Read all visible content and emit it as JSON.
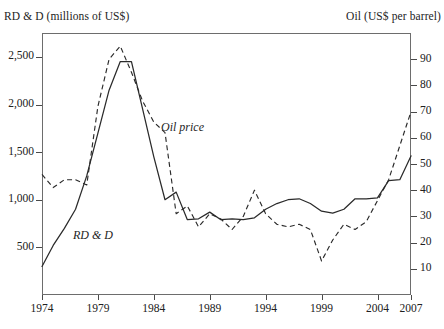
{
  "titles": {
    "left_axis": "RD & D (millions of US$)",
    "right_axis": "Oil (US$ per barrel)"
  },
  "series_labels": {
    "oil": "Oil price",
    "rdd": "RD & D"
  },
  "axes": {
    "left": {
      "label": "RD & D (millions of US$)",
      "ticks": [
        "500",
        "1,000",
        "1,500",
        "2,000",
        "2,500"
      ],
      "values": [
        500,
        1000,
        1500,
        2000,
        2500
      ],
      "range": [
        0,
        2750
      ]
    },
    "right": {
      "label": "Oil (US$ per barrel)",
      "ticks": [
        "10",
        "20",
        "30",
        "40",
        "50",
        "60",
        "70",
        "80",
        "90"
      ],
      "values": [
        10,
        20,
        30,
        40,
        50,
        60,
        70,
        80,
        90
      ],
      "range": [
        0,
        100
      ]
    },
    "bottom": {
      "ticks": [
        "1974",
        "1979",
        "1984",
        "1989",
        "1994",
        "1999",
        "2004",
        "2007"
      ],
      "values": [
        1974,
        1979,
        1984,
        1989,
        1994,
        1999,
        2004,
        2007
      ],
      "range": [
        1974,
        2007
      ]
    }
  },
  "chart_data": {
    "type": "line",
    "title": "",
    "subtitle": "",
    "xlabel": "",
    "ylabel": "RD & D (millions of US$)",
    "y2label": "Oil (US$ per barrel)",
    "xlim": [
      1974,
      2007
    ],
    "ylim": [
      0,
      2750
    ],
    "y2lim": [
      0,
      100
    ],
    "grid": false,
    "legend": "inline-annotations",
    "x": [
      1974,
      1975,
      1976,
      1977,
      1978,
      1979,
      1980,
      1981,
      1982,
      1983,
      1984,
      1985,
      1986,
      1987,
      1988,
      1989,
      1990,
      1991,
      1992,
      1993,
      1994,
      1995,
      1996,
      1997,
      1998,
      1999,
      2000,
      2001,
      2002,
      2003,
      2004,
      2005,
      2006,
      2007
    ],
    "series": [
      {
        "name": "RD & D",
        "label": "RD & D",
        "axis": "left",
        "style": "solid",
        "units": "millions of US$",
        "values": [
          300,
          520,
          700,
          900,
          1250,
          1700,
          2150,
          2450,
          2450,
          1950,
          1450,
          1000,
          1080,
          790,
          800,
          870,
          790,
          800,
          790,
          810,
          900,
          960,
          1000,
          1010,
          960,
          880,
          860,
          900,
          1010,
          1010,
          1020,
          1200,
          1210,
          1460
        ]
      },
      {
        "name": "Oil price",
        "label": "Oil price",
        "axis": "right",
        "style": "dashed",
        "units": "US$ per barrel",
        "values": [
          46,
          41,
          44,
          44,
          42,
          72,
          90,
          95,
          85,
          74,
          66,
          62,
          31,
          34,
          26,
          31,
          29,
          25,
          30,
          40,
          31,
          27,
          26,
          27,
          25,
          13,
          21,
          27,
          25,
          28,
          36,
          44,
          57,
          70
        ]
      }
    ]
  }
}
